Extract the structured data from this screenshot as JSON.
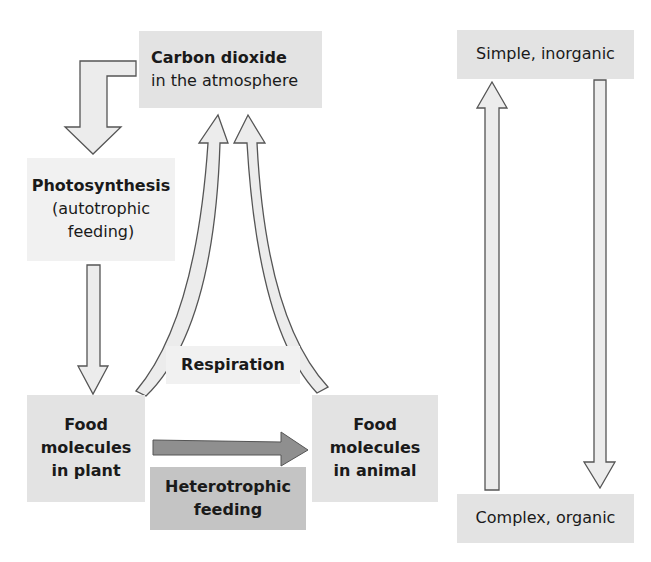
{
  "diagram": {
    "carbon_dioxide": {
      "title": "Carbon dioxide",
      "subtitle": "in the atmosphere"
    },
    "photosynthesis": {
      "title": "Photosynthesis",
      "line2": "(autotrophic",
      "line3": "feeding)"
    },
    "respiration": {
      "label": "Respiration"
    },
    "food_plant": {
      "line1": "Food",
      "line2": "molecules",
      "line3": "in plant"
    },
    "food_animal": {
      "line1": "Food",
      "line2": "molecules",
      "line3": "in animal"
    },
    "heterotrophic": {
      "line1": "Heterotrophic",
      "line2": "feeding"
    },
    "simple": {
      "label": "Simple, inorganic"
    },
    "complex": {
      "label": "Complex, organic"
    }
  },
  "colors": {
    "box": "#e3e3e3",
    "box_light": "#f1f1f1",
    "box_dark": "#c4c4c4",
    "arrow_fill": "#ececec",
    "arrow_dark": "#8f8f8f",
    "outline": "#555555"
  }
}
